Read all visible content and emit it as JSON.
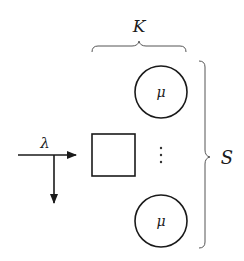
{
  "diagram": {
    "type": "queueing-system",
    "arrival_rate_label": "λ",
    "server_count_label": "K",
    "capacity_label": "S",
    "servers": [
      {
        "label": "μ"
      },
      {
        "label": "μ"
      }
    ],
    "ellipsis": "⋮",
    "queue": {
      "shape": "square"
    },
    "colors": {
      "stroke": "#1a1a1a",
      "brace": "#555555",
      "background": "#ffffff"
    }
  }
}
